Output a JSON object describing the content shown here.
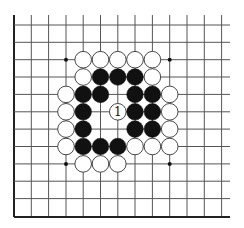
{
  "diagram": {
    "type": "go-board-fragment",
    "grid": {
      "columns_x": [
        14,
        31.3,
        48.6,
        66,
        83.2,
        100.5,
        117.8,
        135,
        152.4,
        169.7,
        187,
        204.3,
        221.6
      ],
      "rows_y": [
        25,
        42.3,
        59.7,
        77,
        94.4,
        111.8,
        129.1,
        146.5,
        163.9,
        181.2,
        198.6,
        217
      ],
      "top_extent": 15,
      "right_extent": 230,
      "left_edge_board": true,
      "bottom_edge_board": true,
      "line_color": "#555555",
      "edge_color": "#222222"
    },
    "star_points": [
      {
        "col": 3,
        "row": 2
      },
      {
        "col": 9,
        "row": 2
      },
      {
        "col": 3,
        "row": 8
      },
      {
        "col": 9,
        "row": 8
      }
    ],
    "stones": [
      {
        "color": "white",
        "col": 4,
        "row": 2
      },
      {
        "color": "white",
        "col": 5,
        "row": 2
      },
      {
        "color": "white",
        "col": 6,
        "row": 2
      },
      {
        "color": "white",
        "col": 7,
        "row": 2
      },
      {
        "color": "white",
        "col": 8,
        "row": 2
      },
      {
        "color": "white",
        "col": 4,
        "row": 3
      },
      {
        "color": "black",
        "col": 5,
        "row": 3
      },
      {
        "color": "black",
        "col": 6,
        "row": 3
      },
      {
        "color": "black",
        "col": 7,
        "row": 3
      },
      {
        "color": "white",
        "col": 8,
        "row": 3
      },
      {
        "color": "white",
        "col": 3,
        "row": 4
      },
      {
        "color": "black",
        "col": 4,
        "row": 4
      },
      {
        "color": "black",
        "col": 5,
        "row": 4
      },
      {
        "color": "black",
        "col": 7,
        "row": 4
      },
      {
        "color": "black",
        "col": 8,
        "row": 4
      },
      {
        "color": "white",
        "col": 9,
        "row": 4
      },
      {
        "color": "white",
        "col": 3,
        "row": 5
      },
      {
        "color": "black",
        "col": 4,
        "row": 5
      },
      {
        "color": "white",
        "col": 6,
        "row": 5,
        "label": "1"
      },
      {
        "color": "black",
        "col": 7,
        "row": 5
      },
      {
        "color": "black",
        "col": 8,
        "row": 5
      },
      {
        "color": "white",
        "col": 9,
        "row": 5
      },
      {
        "color": "white",
        "col": 3,
        "row": 6
      },
      {
        "color": "black",
        "col": 4,
        "row": 6
      },
      {
        "color": "black",
        "col": 7,
        "row": 6
      },
      {
        "color": "black",
        "col": 8,
        "row": 6
      },
      {
        "color": "white",
        "col": 9,
        "row": 6
      },
      {
        "color": "white",
        "col": 3,
        "row": 7
      },
      {
        "color": "black",
        "col": 4,
        "row": 7
      },
      {
        "color": "black",
        "col": 5,
        "row": 7
      },
      {
        "color": "black",
        "col": 6,
        "row": 7
      },
      {
        "color": "white",
        "col": 7,
        "row": 7
      },
      {
        "color": "white",
        "col": 8,
        "row": 7
      },
      {
        "color": "white",
        "col": 9,
        "row": 7
      },
      {
        "color": "white",
        "col": 4,
        "row": 8
      },
      {
        "color": "white",
        "col": 5,
        "row": 8
      },
      {
        "color": "white",
        "col": 6,
        "row": 8
      }
    ],
    "move_label": "1",
    "stone_radius": 8.3,
    "colors": {
      "black_stone": "#111111",
      "white_stone": "#ffffff",
      "white_stone_outline": "#333333",
      "background": "#ffffff"
    }
  }
}
